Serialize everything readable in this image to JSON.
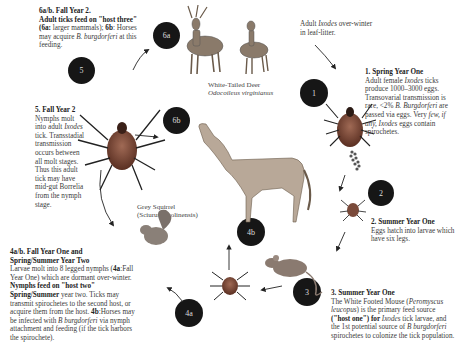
{
  "stages": {
    "s6": {
      "title": "6a/b. Fall Year 2.",
      "lead": "Adult ticks feed on \"host three\"",
      "body_a_label": "(6a:",
      "body_a": " larger mammals);",
      "body_b_label": " 6b",
      "body_b": ": Horses may acquire ",
      "species": "B. burgdorferi",
      "tail": " at this feeding."
    },
    "s5": {
      "title": "5. Fall Year 2",
      "body1": "Nymphs molt into adult ",
      "genus": "Ixodes",
      "body2": " tick. Transstadial transmission occurs between all molt stages. Thus this adult tick may have mid-gut Borrelia from the nymph stage."
    },
    "intro": {
      "pre": "Adult ",
      "genus": "Ixodes",
      "post": " over-winter in leaf-litter."
    },
    "s1": {
      "title": "1.  Spring Year One",
      "body1": "Adult female ",
      "genus": "Ixodes",
      "body2": " ticks produce 1000–3000 eggs. Transovarial transmission is rare, <2% ",
      "species": "B. Burgdorferi",
      "body3": " are passed via eggs. Very ",
      "few": "few, if any, ",
      "genus2": "Ixodes",
      "body4": " eggs contain spirochetes."
    },
    "s2": {
      "title": "2. Summer Year One",
      "body": "Eggs hatch into larvae which have six legs."
    },
    "s3": {
      "title": "3. Summer Year One",
      "body1": "The White Footed Mouse (",
      "species": "Peromyscus leucopus",
      "body2": ") is the primary feed source ",
      "host": "(\"host one\") for ",
      "genus": "Ixodes",
      "body3": " tick larvae, and the 1st potential source of ",
      "species2": "B burgdorferi",
      "body4": " spirochetes to colonize the tick population."
    },
    "s4": {
      "title1": "4a/b. Fall Year One and",
      "title2": "Spring/Summer Year Two",
      "body1": "Larvae molt into 8 legged nymphs (",
      "l4a": "4a",
      "body2": ":Fall Year One) which are dormant over-winter.",
      "bold": " Nymphs feed on \"host two\" Spring/Summer",
      "body3": " year two. Ticks may transmit spirochetes to the second host, or acquire them from the host. ",
      "l4b": "4b",
      "body4": ":Horses may be infected with ",
      "species": "B burgdorferi",
      "body5": " via nymph attachment and feeding (if the tick harbors the spirochete)."
    }
  },
  "captions": {
    "deer_common": "White-Tailed Deer",
    "deer_latin": "Odocoileus virginianus",
    "squirrel_common": "Grey Squirrel",
    "squirrel_latin": "(Sciurus carolinensis)"
  },
  "markers": [
    "1",
    "2",
    "3",
    "4a",
    "4b",
    "5",
    "6a",
    "6b"
  ],
  "colors": {
    "marker_bg": "#161616",
    "marker_text": "#dddddd",
    "tick_body": "#7a4a3a"
  }
}
